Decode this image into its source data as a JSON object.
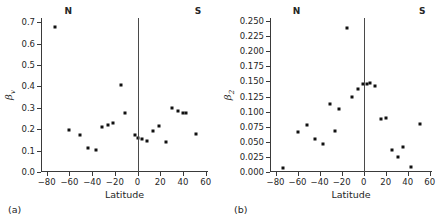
{
  "figure": {
    "width": 440,
    "height": 221,
    "background": "#ffffff",
    "marker_color": "#111111",
    "axis_color": "#3a3a3a"
  },
  "panels": [
    {
      "tag": "(a)",
      "hemisphere_left": "N",
      "hemisphere_right": "S",
      "chart_data": {
        "type": "scatter",
        "title": "",
        "xlabel": "Latitude",
        "ylabel": "βv",
        "ylabel_base": "β",
        "ylabel_sub": "v",
        "xlim": [
          -85,
          62
        ],
        "ylim": [
          0.0,
          0.72
        ],
        "xticks": [
          -80,
          -60,
          -40,
          -20,
          0,
          20,
          40,
          60
        ],
        "xticklabels": [
          "−80",
          "−60",
          "−40",
          "−20",
          "0",
          "20",
          "40",
          "60"
        ],
        "yticks": [
          0.0,
          0.1,
          0.2,
          0.3,
          0.4,
          0.5,
          0.6,
          0.7
        ],
        "yticklabels": [
          "0.0",
          "0.1",
          "0.2",
          "0.3",
          "0.4",
          "0.5",
          "0.6",
          "0.7"
        ],
        "grid": false,
        "legend": "none",
        "reference_line_x": 0,
        "x": [
          -73,
          -60,
          -51,
          -44,
          -37,
          -31,
          -26,
          -22,
          -15,
          -11,
          -2,
          0,
          4,
          8,
          14,
          19,
          25,
          30,
          36,
          40,
          43,
          51
        ],
        "y": [
          0.68,
          0.196,
          0.173,
          0.11,
          0.104,
          0.211,
          0.221,
          0.228,
          0.407,
          0.277,
          0.172,
          0.16,
          0.154,
          0.143,
          0.192,
          0.217,
          0.14,
          0.3,
          0.285,
          0.278,
          0.278,
          0.179
        ]
      }
    },
    {
      "tag": "(b)",
      "hemisphere_left": "N",
      "hemisphere_right": "S",
      "chart_data": {
        "type": "scatter",
        "title": "",
        "xlabel": "Latitude",
        "ylabel": "β2",
        "ylabel_base": "β",
        "ylabel_sub": "2",
        "xlim": [
          -85,
          62
        ],
        "ylim": [
          0.0,
          0.255
        ],
        "xticks": [
          -80,
          -60,
          -40,
          -20,
          0,
          20,
          40,
          60
        ],
        "xticklabels": [
          "−80",
          "−60",
          "−40",
          "−20",
          "0",
          "20",
          "40",
          "60"
        ],
        "yticks": [
          0.0,
          0.025,
          0.05,
          0.075,
          0.1,
          0.125,
          0.15,
          0.175,
          0.2,
          0.225,
          0.25
        ],
        "yticklabels": [
          "0.000",
          "0.025",
          "0.050",
          "0.075",
          "0.100",
          "0.125",
          "0.150",
          "0.175",
          "0.200",
          "0.225",
          "0.250"
        ],
        "grid": false,
        "legend": "none",
        "reference_line_x": 0,
        "x": [
          -73,
          -60,
          -51,
          -44,
          -37,
          -31,
          -26,
          -22,
          -15,
          -11,
          -5,
          -1,
          3,
          6,
          10,
          16,
          20,
          26,
          31,
          36,
          43,
          51
        ],
        "y": [
          0.007,
          0.067,
          0.077,
          0.055,
          0.046,
          0.113,
          0.068,
          0.104,
          0.238,
          0.124,
          0.137,
          0.146,
          0.145,
          0.148,
          0.142,
          0.087,
          0.09,
          0.036,
          0.025,
          0.042,
          0.009,
          0.08
        ]
      }
    }
  ]
}
